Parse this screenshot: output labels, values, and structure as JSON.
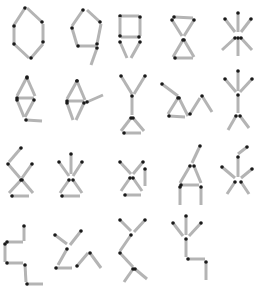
{
  "colors": {
    "background": "#ffffff",
    "stick": "#b4b4b4",
    "head": "#1a1a1a"
  },
  "figures": [
    {
      "id": "r1c1",
      "name": "hexagon",
      "sticks": [
        [
          25,
          8,
          14,
          25
        ],
        [
          14,
          26,
          14,
          43
        ],
        [
          14,
          44,
          29,
          58
        ],
        [
          31,
          58,
          43,
          44
        ],
        [
          43,
          42,
          43,
          24
        ],
        [
          42,
          22,
          27,
          8
        ]
      ]
    },
    {
      "id": "r1c2",
      "name": "nine-shape",
      "sticks": [
        [
          83,
          10,
          72,
          26
        ],
        [
          72,
          28,
          77,
          45
        ],
        [
          78,
          46,
          96,
          46
        ],
        [
          97,
          44,
          101,
          24
        ],
        [
          100,
          22,
          87,
          10
        ],
        [
          97,
          48,
          91,
          65
        ]
      ]
    },
    {
      "id": "r1c3",
      "name": "square-with-v",
      "sticks": [
        [
          120,
          16,
          139,
          16
        ],
        [
          140,
          17,
          140,
          36
        ],
        [
          139,
          37,
          121,
          37
        ],
        [
          120,
          36,
          120,
          17
        ],
        [
          120,
          42,
          127,
          58
        ],
        [
          140,
          42,
          131,
          58
        ]
      ]
    },
    {
      "id": "r1c4",
      "name": "hourglass",
      "sticks": [
        [
          174,
          17,
          193,
          18
        ],
        [
          172,
          20,
          182,
          36
        ],
        [
          194,
          20,
          184,
          36
        ],
        [
          183,
          40,
          173,
          57
        ],
        [
          184,
          40,
          194,
          57
        ],
        [
          175,
          58,
          193,
          58
        ]
      ]
    },
    {
      "id": "r1c5",
      "name": "star",
      "sticks": [
        [
          238,
          13,
          238,
          32
        ],
        [
          225,
          19,
          235,
          32
        ],
        [
          251,
          19,
          241,
          32
        ],
        [
          235,
          38,
          222,
          50
        ],
        [
          238,
          38,
          238,
          56
        ],
        [
          241,
          38,
          252,
          50
        ]
      ]
    },
    {
      "id": "r2c1",
      "name": "diamond-with-tail",
      "sticks": [
        [
          27,
          77,
          17,
          96
        ],
        [
          27,
          78,
          35,
          96
        ],
        [
          17,
          98,
          34,
          98
        ],
        [
          17,
          100,
          24,
          117
        ],
        [
          34,
          100,
          25,
          117
        ],
        [
          26,
          120,
          42,
          121
        ]
      ]
    },
    {
      "id": "r2c2",
      "name": "diamond-with-arm",
      "sticks": [
        [
          77,
          81,
          67,
          99
        ],
        [
          77,
          81,
          85,
          100
        ],
        [
          67,
          101,
          84,
          101
        ],
        [
          67,
          103,
          73,
          120
        ],
        [
          84,
          103,
          76,
          120
        ],
        [
          87,
          102,
          103,
          95
        ]
      ]
    },
    {
      "id": "r2c3",
      "name": "y-over-triangle",
      "sticks": [
        [
          121,
          76,
          132,
          94
        ],
        [
          145,
          76,
          134,
          94
        ],
        [
          132,
          96,
          132,
          115
        ],
        [
          131,
          118,
          121,
          131
        ],
        [
          133,
          118,
          144,
          131
        ],
        [
          124,
          133,
          141,
          133
        ]
      ]
    },
    {
      "id": "r2c4",
      "name": "triangle-zigzag",
      "sticks": [
        [
          162,
          84,
          178,
          96
        ],
        [
          178,
          98,
          168,
          114
        ],
        [
          179,
          98,
          188,
          116
        ],
        [
          169,
          116,
          185,
          117
        ],
        [
          190,
          114,
          200,
          98
        ],
        [
          202,
          96,
          212,
          112
        ]
      ]
    },
    {
      "id": "r2c5",
      "name": "tree-figure",
      "sticks": [
        [
          238,
          71,
          238,
          91
        ],
        [
          225,
          79,
          236,
          92
        ],
        [
          252,
          79,
          240,
          92
        ],
        [
          238,
          95,
          238,
          113
        ],
        [
          236,
          116,
          228,
          130
        ],
        [
          240,
          116,
          249,
          128
        ]
      ]
    },
    {
      "id": "r3c1",
      "name": "x-with-arm",
      "sticks": [
        [
          21,
          148,
          9,
          162
        ],
        [
          8,
          164,
          20,
          178
        ],
        [
          32,
          164,
          22,
          178
        ],
        [
          21,
          180,
          9,
          193
        ],
        [
          22,
          180,
          33,
          193
        ],
        [
          12,
          196,
          29,
          196
        ]
      ]
    },
    {
      "id": "r3c2",
      "name": "star-with-base",
      "sticks": [
        [
          71,
          154,
          71,
          174
        ],
        [
          59,
          162,
          69,
          176
        ],
        [
          82,
          162,
          73,
          176
        ],
        [
          69,
          180,
          60,
          193
        ],
        [
          73,
          180,
          82,
          193
        ],
        [
          62,
          196,
          80,
          196
        ]
      ]
    },
    {
      "id": "r3c3",
      "name": "x-with-side",
      "sticks": [
        [
          120,
          162,
          131,
          174
        ],
        [
          143,
          162,
          133,
          174
        ],
        [
          130,
          178,
          121,
          191
        ],
        [
          133,
          178,
          142,
          191
        ],
        [
          145,
          169,
          145,
          186
        ],
        [
          125,
          195,
          141,
          195
        ]
      ]
    },
    {
      "id": "r3c4",
      "name": "a-frame",
      "sticks": [
        [
          200,
          146,
          192,
          163
        ],
        [
          190,
          166,
          180,
          183
        ],
        [
          194,
          166,
          201,
          183
        ],
        [
          181,
          185,
          199,
          185
        ],
        [
          180,
          187,
          180,
          205
        ],
        [
          201,
          187,
          201,
          205
        ]
      ]
    },
    {
      "id": "r3c5",
      "name": "asterisk-with-arm",
      "sticks": [
        [
          247,
          147,
          238,
          154
        ],
        [
          238,
          157,
          238,
          177
        ],
        [
          222,
          167,
          235,
          178
        ],
        [
          252,
          169,
          241,
          178
        ],
        [
          235,
          182,
          227,
          194
        ],
        [
          241,
          182,
          249,
          194
        ]
      ]
    },
    {
      "id": "r4c1",
      "name": "stairs",
      "sticks": [
        [
          24,
          226,
          24,
          241
        ],
        [
          7,
          242,
          23,
          242
        ],
        [
          5,
          244,
          5,
          262
        ],
        [
          7,
          263,
          23,
          263
        ],
        [
          25,
          265,
          26,
          282
        ],
        [
          27,
          284,
          43,
          284
        ]
      ]
    },
    {
      "id": "r4c2",
      "name": "branch-zigzag",
      "sticks": [
        [
          55,
          235,
          67,
          244
        ],
        [
          81,
          231,
          70,
          245
        ],
        [
          67,
          249,
          58,
          265
        ],
        [
          56,
          268,
          72,
          268
        ],
        [
          77,
          266,
          88,
          253
        ],
        [
          90,
          253,
          101,
          268
        ]
      ]
    },
    {
      "id": "r4c3",
      "name": "double-y",
      "sticks": [
        [
          120,
          220,
          131,
          231
        ],
        [
          145,
          220,
          134,
          232
        ],
        [
          131,
          235,
          120,
          251
        ],
        [
          120,
          253,
          133,
          267
        ],
        [
          133,
          269,
          124,
          282
        ],
        [
          135,
          269,
          147,
          279
        ]
      ]
    },
    {
      "id": "r4c4",
      "name": "tree-with-hook",
      "sticks": [
        [
          186,
          216,
          186,
          235
        ],
        [
          173,
          223,
          183,
          236
        ],
        [
          201,
          223,
          189,
          236
        ],
        [
          186,
          239,
          186,
          257
        ],
        [
          188,
          259,
          205,
          259
        ],
        [
          206,
          262,
          206,
          280
        ]
      ]
    }
  ]
}
